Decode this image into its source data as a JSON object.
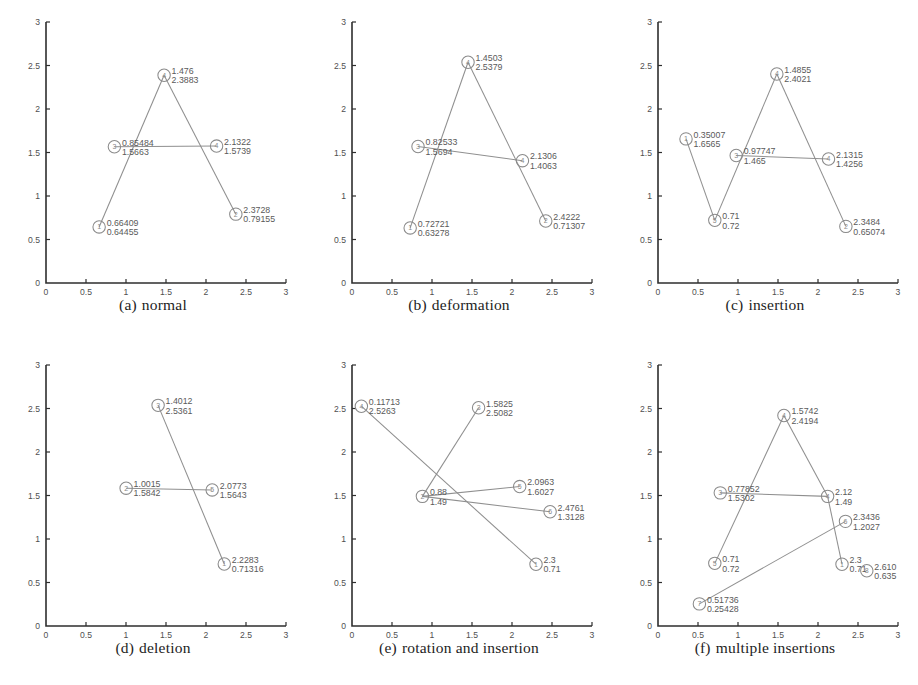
{
  "figure": {
    "background": "#ffffff",
    "line_color": "#8f8f8f",
    "axis_color": "#2e2e2e",
    "label_color": "#5a5a5a"
  },
  "chart_data": [
    {
      "id": "a",
      "type": "scatter",
      "title": "(a) normal",
      "caption_tag": "(a)",
      "caption_text": "normal",
      "xlabel": "",
      "ylabel": "",
      "xlim": [
        0,
        3
      ],
      "ylim": [
        0,
        3
      ],
      "xticks": [
        "0",
        "0.5",
        "1",
        "1.5",
        "2",
        "2.5",
        "3"
      ],
      "yticks": [
        "0",
        "0.5",
        "1",
        "1.5",
        "2",
        "2.5",
        "3"
      ],
      "grid": false,
      "legend": "none",
      "points": [
        {
          "id": "1",
          "x": 0.66409,
          "y": 0.64455,
          "label_x": "0.66409",
          "label_y": "0.64455",
          "label_pos": "right"
        },
        {
          "id": "3",
          "x": 0.85484,
          "y": 1.5663,
          "label_x": "0.85484",
          "label_y": "1.5663",
          "label_pos": "right"
        },
        {
          "id": "4",
          "x": 1.476,
          "y": 2.3883,
          "label_x": "1.476",
          "label_y": "2.3883",
          "label_pos": "right"
        },
        {
          "id": "4b",
          "x": 2.1322,
          "y": 1.5739,
          "label_x": "2.1322",
          "label_y": "1.5739",
          "label_pos": "right"
        },
        {
          "id": "2",
          "x": 2.3728,
          "y": 0.79155,
          "label_x": "2.3728",
          "label_y": "0.79155",
          "label_pos": "right"
        }
      ],
      "edges": [
        [
          0,
          2
        ],
        [
          2,
          4
        ],
        [
          1,
          3
        ]
      ]
    },
    {
      "id": "b",
      "type": "scatter",
      "title": "(b) deformation",
      "caption_tag": "(b)",
      "caption_text": "deformation",
      "xlabel": "",
      "ylabel": "",
      "xlim": [
        0,
        3
      ],
      "ylim": [
        0,
        3
      ],
      "xticks": [
        "0",
        "0.5",
        "1",
        "1.5",
        "2",
        "2.5",
        "3"
      ],
      "yticks": [
        "0",
        "0.5",
        "1",
        "1.5",
        "2",
        "2.5",
        "3"
      ],
      "grid": false,
      "legend": "none",
      "points": [
        {
          "id": "1",
          "x": 0.72721,
          "y": 0.63278,
          "label_x": "0.72721",
          "label_y": "0.63278",
          "label_pos": "right"
        },
        {
          "id": "3",
          "x": 0.82533,
          "y": 1.5694,
          "label_x": "0.82533",
          "label_y": "1.5694",
          "label_pos": "right"
        },
        {
          "id": "4",
          "x": 1.4503,
          "y": 2.5379,
          "label_x": "1.4503",
          "label_y": "2.5379",
          "label_pos": "right"
        },
        {
          "id": "4b",
          "x": 2.1306,
          "y": 1.4063,
          "label_x": "2.1306",
          "label_y": "1.4063",
          "label_pos": "right"
        },
        {
          "id": "2",
          "x": 2.4222,
          "y": 0.71307,
          "label_x": "2.4222",
          "label_y": "0.71307",
          "label_pos": "right"
        }
      ],
      "edges": [
        [
          0,
          2
        ],
        [
          2,
          4
        ],
        [
          1,
          3
        ]
      ]
    },
    {
      "id": "c",
      "type": "scatter",
      "title": "(c) insertion",
      "caption_tag": "(c)",
      "caption_text": "insertion",
      "xlabel": "",
      "ylabel": "",
      "xlim": [
        0,
        3
      ],
      "ylim": [
        0,
        3
      ],
      "xticks": [
        "0",
        "0.5",
        "1",
        "1.5",
        "2",
        "2.5",
        "3"
      ],
      "yticks": [
        "0",
        "0.5",
        "1",
        "1.5",
        "2",
        "2.5",
        "3"
      ],
      "grid": false,
      "legend": "none",
      "points": [
        {
          "id": "1",
          "x": 0.35007,
          "y": 1.6565,
          "label_x": "0.35007",
          "label_y": "1.6565",
          "label_pos": "right"
        },
        {
          "id": "5",
          "x": 0.71,
          "y": 0.72,
          "label_x": "0.71",
          "label_y": "0.72",
          "label_pos": "right"
        },
        {
          "id": "3",
          "x": 0.97747,
          "y": 1.465,
          "label_x": "0.97747",
          "label_y": "1.465",
          "label_pos": "right"
        },
        {
          "id": "4",
          "x": 1.4855,
          "y": 2.4021,
          "label_x": "1.4855",
          "label_y": "2.4021",
          "label_pos": "right"
        },
        {
          "id": "4b",
          "x": 2.1315,
          "y": 1.4256,
          "label_x": "2.1315",
          "label_y": "1.4256",
          "label_pos": "right"
        },
        {
          "id": "2",
          "x": 2.3484,
          "y": 0.65074,
          "label_x": "2.3484",
          "label_y": "0.65074",
          "label_pos": "right"
        }
      ],
      "edges": [
        [
          0,
          1
        ],
        [
          1,
          3
        ],
        [
          3,
          5
        ],
        [
          2,
          4
        ]
      ]
    },
    {
      "id": "d",
      "type": "scatter",
      "title": "(d) deletion",
      "caption_tag": "(d)",
      "caption_text": "deletion",
      "xlabel": "",
      "ylabel": "",
      "xlim": [
        0,
        3
      ],
      "ylim": [
        0,
        3
      ],
      "xticks": [
        "0",
        "0.5",
        "1",
        "1.5",
        "2",
        "2.5",
        "3"
      ],
      "yticks": [
        "0",
        "0.5",
        "1",
        "1.5",
        "2",
        "2.5",
        "3"
      ],
      "grid": false,
      "legend": "none",
      "points": [
        {
          "id": "2",
          "x": 1.0015,
          "y": 1.5842,
          "label_x": "1.0015",
          "label_y": "1.5842",
          "label_pos": "right"
        },
        {
          "id": "3",
          "x": 1.4012,
          "y": 2.5361,
          "label_x": "1.4012",
          "label_y": "2.5361",
          "label_pos": "right"
        },
        {
          "id": "5",
          "x": 2.0773,
          "y": 1.5643,
          "label_x": "2.0773",
          "label_y": "1.5643",
          "label_pos": "right"
        },
        {
          "id": "1",
          "x": 2.2283,
          "y": 0.71316,
          "label_x": "2.2283",
          "label_y": "0.71316",
          "label_pos": "right"
        }
      ],
      "edges": [
        [
          0,
          2
        ],
        [
          1,
          3
        ]
      ]
    },
    {
      "id": "e",
      "type": "scatter",
      "title": "(e) rotation and insertion",
      "caption_tag": "(e)",
      "caption_text": "rotation and insertion",
      "xlabel": "",
      "ylabel": "",
      "xlim": [
        0,
        3
      ],
      "ylim": [
        0,
        3
      ],
      "xticks": [
        "0",
        "0.5",
        "1",
        "1.5",
        "2",
        "2.5",
        "3"
      ],
      "yticks": [
        "0",
        "0.5",
        "1",
        "1.5",
        "2",
        "2.5",
        "3"
      ],
      "grid": false,
      "legend": "none",
      "points": [
        {
          "id": "4",
          "x": 0.11713,
          "y": 2.5263,
          "label_x": "0.11713",
          "label_y": "2.5263",
          "label_pos": "right"
        },
        {
          "id": "2",
          "x": 0.88,
          "y": 1.49,
          "label_x": "0.88",
          "label_y": "1.49",
          "label_pos": "right"
        },
        {
          "id": "3",
          "x": 1.5825,
          "y": 2.5082,
          "label_x": "1.5825",
          "label_y": "2.5082",
          "label_pos": "right"
        },
        {
          "id": "5",
          "x": 2.0963,
          "y": 1.6027,
          "label_x": "2.0963",
          "label_y": "1.6027",
          "label_pos": "right"
        },
        {
          "id": "6",
          "x": 2.4761,
          "y": 1.3128,
          "label_x": "2.4761",
          "label_y": "1.3128",
          "label_pos": "right"
        },
        {
          "id": "1",
          "x": 2.3,
          "y": 0.71,
          "label_x": "2.3",
          "label_y": "0.71",
          "label_pos": "right"
        }
      ],
      "edges": [
        [
          0,
          5
        ],
        [
          2,
          1
        ],
        [
          1,
          3
        ],
        [
          1,
          4
        ]
      ]
    },
    {
      "id": "f",
      "type": "scatter",
      "title": "(f) multiple insertions",
      "caption_tag": "(f)",
      "caption_text": "multiple insertions",
      "xlabel": "",
      "ylabel": "",
      "xlim": [
        0,
        3
      ],
      "ylim": [
        0,
        3
      ],
      "xticks": [
        "0",
        "0.5",
        "1",
        "1.5",
        "2",
        "2.5",
        "3"
      ],
      "yticks": [
        "0",
        "0.5",
        "1",
        "1.5",
        "2",
        "2.5",
        "3"
      ],
      "grid": false,
      "legend": "none",
      "points": [
        {
          "id": "7",
          "x": 0.51736,
          "y": 0.25428,
          "label_x": "0.51736",
          "label_y": "0.25428",
          "label_pos": "right"
        },
        {
          "id": "5",
          "x": 0.71,
          "y": 0.72,
          "label_x": "0.71",
          "label_y": "0.72",
          "label_pos": "right"
        },
        {
          "id": "3",
          "x": 0.77852,
          "y": 1.5302,
          "label_x": "0.77852",
          "label_y": "1.5302",
          "label_pos": "right"
        },
        {
          "id": "4",
          "x": 1.5742,
          "y": 2.4194,
          "label_x": "1.5742",
          "label_y": "2.4194",
          "label_pos": "right"
        },
        {
          "id": "4b",
          "x": 2.12,
          "y": 1.49,
          "label_x": "2.12",
          "label_y": "1.49",
          "label_pos": "right"
        },
        {
          "id": "6",
          "x": 2.3436,
          "y": 1.2027,
          "label_x": "2.3436",
          "label_y": "1.2027",
          "label_pos": "right"
        },
        {
          "id": "1",
          "x": 2.3,
          "y": 0.71,
          "label_x": "2.3",
          "label_y": "0.71",
          "label_pos": "right"
        },
        {
          "id": "8",
          "x": 2.61,
          "y": 0.635,
          "label_x": "2.610",
          "label_y": "0.635",
          "label_pos": "right"
        }
      ],
      "edges": [
        [
          1,
          3
        ],
        [
          3,
          4
        ],
        [
          4,
          6
        ],
        [
          2,
          4
        ],
        [
          0,
          5
        ]
      ]
    }
  ]
}
